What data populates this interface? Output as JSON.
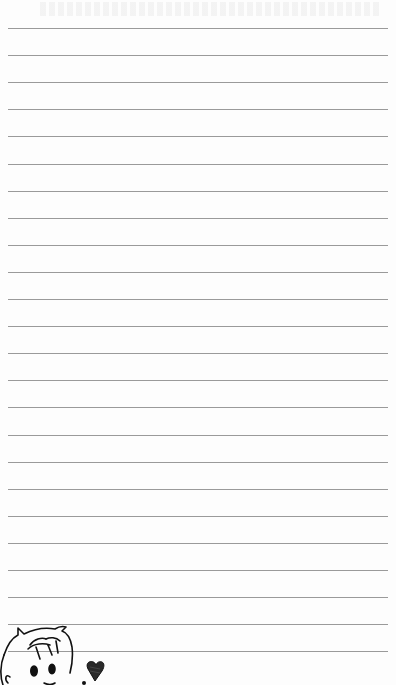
{
  "page": {
    "type": "lined-notebook-page",
    "background_color": "#fdfdfd",
    "rule_color": "#9a9a9a",
    "rule_count": 24,
    "rule_start_y": 28,
    "rule_spacing": 27.1,
    "rule_left": 8,
    "rule_right": 388
  },
  "doodle": {
    "subject": "cartoon-boy-face-with-heart",
    "icons": [
      "boy-face-icon",
      "heart-icon"
    ]
  }
}
